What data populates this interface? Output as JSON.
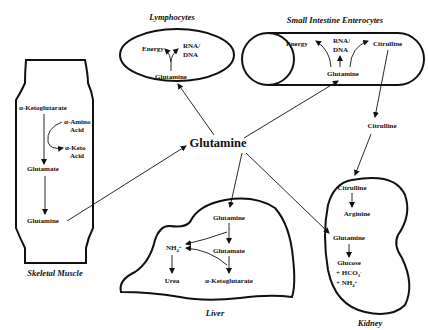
{
  "center": {
    "label": "Glutamine"
  },
  "organs": {
    "lymphocytes": {
      "title": "Lymphocytes",
      "items": {
        "energy": "Energy",
        "rna": "RNA/",
        "dna": "DNA",
        "glutamine": "Glutamine"
      }
    },
    "enterocytes": {
      "title": "Small Intestine Enterocytes",
      "items": {
        "energy": "Energy",
        "rna": "RNA/",
        "dna": "DNA",
        "citrulline": "Citrulline",
        "glutamine": "Glutamine"
      }
    },
    "muscle": {
      "title": "Skeletal Muscle",
      "items": {
        "akg": "α-Ketoglutarate",
        "amino1": "α-Amino",
        "amino2": "Acid",
        "keto1": "α-Keto",
        "keto2": "Acid",
        "glutamate": "Glutamate",
        "glutamine": "Glutamine"
      }
    },
    "liver": {
      "title": "Liver",
      "items": {
        "glutamine": "Glutamine",
        "nh4": "NH",
        "nh4_sub": "4",
        "nh4_sup": "+",
        "glutamate": "Glutamate",
        "urea": "Urea",
        "akg": "α-Ketoglutarate"
      }
    },
    "kidney": {
      "title": "Kidney",
      "items": {
        "citrulline": "Citrulline",
        "arginine": "Arginine",
        "glutamine": "Glutamine",
        "glucose": "Glucose",
        "hco3": "+ HCO",
        "hco3_sub": "3",
        "hco3_sup": "-",
        "nh4": "+ NH",
        "nh4_sub": "4",
        "nh4_sup": "+"
      }
    }
  },
  "intermediate": {
    "citrulline": "Citrulline"
  }
}
